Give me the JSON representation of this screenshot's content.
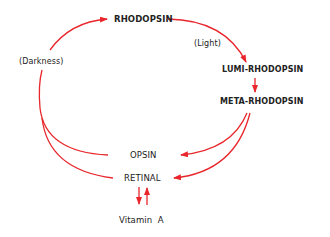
{
  "diagram": {
    "type": "cycle",
    "arrow_color": "#e8262b",
    "text_color": "#222222",
    "nodes": {
      "rhodopsin": "RHODOPSIN",
      "lumi_rhodopsin": "LUMI-RHODOPSIN",
      "meta_rhodopsin": "META-RHODOPSIN",
      "opsin": "OPSIN",
      "retinal": "RETINAL",
      "vitamin_a": "Vitamin  A"
    },
    "annotations": {
      "light": "(Light)",
      "darkness": "(Darkness)"
    },
    "edges": [
      {
        "from": "RHODOPSIN",
        "to": "LUMI-RHODOPSIN",
        "label": "(Light)"
      },
      {
        "from": "LUMI-RHODOPSIN",
        "to": "META-RHODOPSIN"
      },
      {
        "from": "META-RHODOPSIN",
        "to": "OPSIN"
      },
      {
        "from": "META-RHODOPSIN",
        "to": "RETINAL"
      },
      {
        "from": "OPSIN",
        "to": "RHODOPSIN",
        "label": "(Darkness)"
      },
      {
        "from": "RETINAL",
        "to": "RHODOPSIN",
        "label": "(Darkness)"
      },
      {
        "from": "RETINAL",
        "to": "Vitamin A"
      },
      {
        "from": "Vitamin A",
        "to": "RETINAL"
      }
    ]
  }
}
